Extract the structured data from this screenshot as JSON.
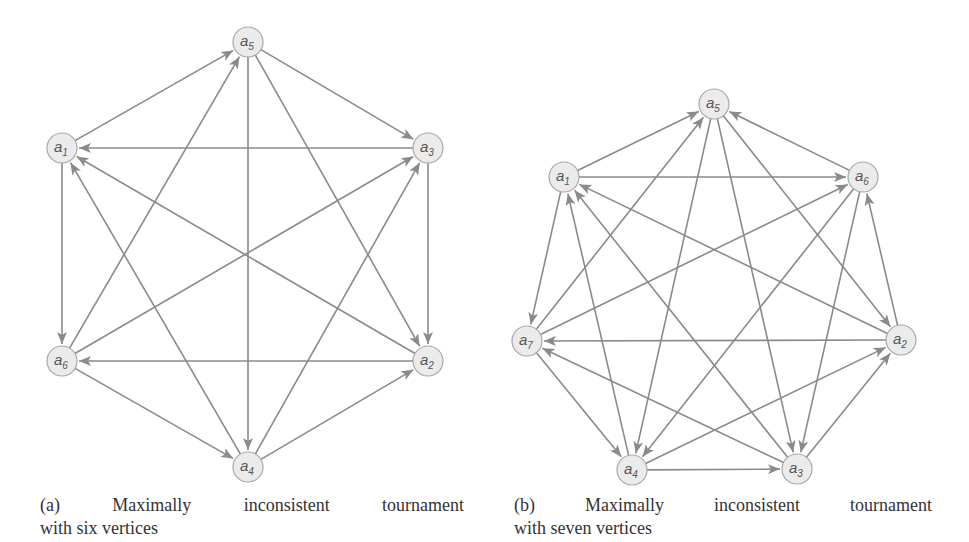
{
  "figures": [
    {
      "id": "a",
      "caption_line1": "(a) Maximally inconsistent tournament",
      "caption_line2": "with six vertices",
      "nodes": [
        {
          "id": "a5",
          "sub": "5",
          "x": 248,
          "y": 42
        },
        {
          "id": "a1",
          "sub": "1",
          "x": 62,
          "y": 148
        },
        {
          "id": "a3",
          "sub": "3",
          "x": 428,
          "y": 148
        },
        {
          "id": "a6",
          "sub": "6",
          "x": 62,
          "y": 361
        },
        {
          "id": "a2",
          "sub": "2",
          "x": 428,
          "y": 361
        },
        {
          "id": "a4",
          "sub": "4",
          "x": 248,
          "y": 467
        }
      ],
      "edges": [
        [
          "a1",
          "a5"
        ],
        [
          "a6",
          "a5"
        ],
        [
          "a5",
          "a3"
        ],
        [
          "a5",
          "a4"
        ],
        [
          "a5",
          "a2"
        ],
        [
          "a3",
          "a1"
        ],
        [
          "a2",
          "a1"
        ],
        [
          "a4",
          "a1"
        ],
        [
          "a1",
          "a6"
        ],
        [
          "a6",
          "a3"
        ],
        [
          "a4",
          "a3"
        ],
        [
          "a3",
          "a2"
        ],
        [
          "a4",
          "a2"
        ],
        [
          "a2",
          "a6"
        ],
        [
          "a6",
          "a4"
        ]
      ]
    },
    {
      "id": "b",
      "caption_line1": "(b) Maximally inconsistent tournament",
      "caption_line2": "with seven vertices",
      "nodes": [
        {
          "id": "a5",
          "sub": "5",
          "x": 714,
          "y": 104
        },
        {
          "id": "a1",
          "sub": "1",
          "x": 564,
          "y": 177
        },
        {
          "id": "a6",
          "sub": "6",
          "x": 863,
          "y": 177
        },
        {
          "id": "a7",
          "sub": "7",
          "x": 527,
          "y": 341
        },
        {
          "id": "a2",
          "sub": "2",
          "x": 901,
          "y": 340
        },
        {
          "id": "a4",
          "sub": "4",
          "x": 632,
          "y": 470
        },
        {
          "id": "a3",
          "sub": "3",
          "x": 797,
          "y": 469
        }
      ],
      "edges": [
        [
          "a1",
          "a5"
        ],
        [
          "a7",
          "a5"
        ],
        [
          "a6",
          "a5"
        ],
        [
          "a5",
          "a4"
        ],
        [
          "a5",
          "a3"
        ],
        [
          "a5",
          "a2"
        ],
        [
          "a1",
          "a6"
        ],
        [
          "a1",
          "a7"
        ],
        [
          "a4",
          "a1"
        ],
        [
          "a3",
          "a1"
        ],
        [
          "a2",
          "a1"
        ],
        [
          "a7",
          "a6"
        ],
        [
          "a2",
          "a6"
        ],
        [
          "a6",
          "a4"
        ],
        [
          "a6",
          "a3"
        ],
        [
          "a2",
          "a7"
        ],
        [
          "a3",
          "a7"
        ],
        [
          "a7",
          "a4"
        ],
        [
          "a4",
          "a2"
        ],
        [
          "a3",
          "a2"
        ],
        [
          "a4",
          "a3"
        ]
      ]
    }
  ],
  "style": {
    "edge_color": "#8a8a8a",
    "node_fill": "#ebebeb",
    "node_stroke": "#a8a8a8",
    "node_radius": 15
  }
}
